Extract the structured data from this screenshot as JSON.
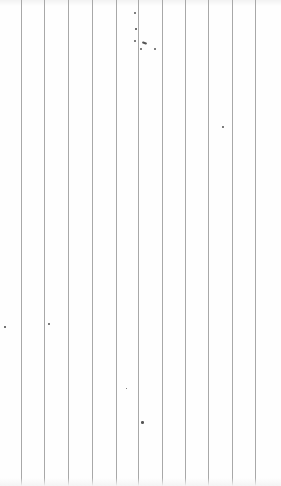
{
  "paper": {
    "background": "#fefefe",
    "line_color": "#a8a8a8",
    "line_positions_px": [
      21,
      44,
      68,
      92,
      116,
      138,
      162,
      185,
      208,
      232,
      255
    ],
    "specks": [
      {
        "x": 134,
        "y": 12,
        "r": 1.2
      },
      {
        "x": 135,
        "y": 28,
        "r": 0.8
      },
      {
        "x": 134,
        "y": 40,
        "r": 1.0
      },
      {
        "x": 142,
        "y": 42,
        "w": 5,
        "h": 2
      },
      {
        "x": 140,
        "y": 48,
        "r": 1.0
      },
      {
        "x": 154,
        "y": 48,
        "r": 1.0
      },
      {
        "x": 222,
        "y": 126,
        "r": 0.9
      },
      {
        "x": 4,
        "y": 326,
        "r": 0.8
      },
      {
        "x": 48,
        "y": 323,
        "r": 0.9
      },
      {
        "x": 141,
        "y": 421,
        "r": 1.3
      },
      {
        "x": 126,
        "y": 388,
        "r": 0.7
      }
    ]
  }
}
